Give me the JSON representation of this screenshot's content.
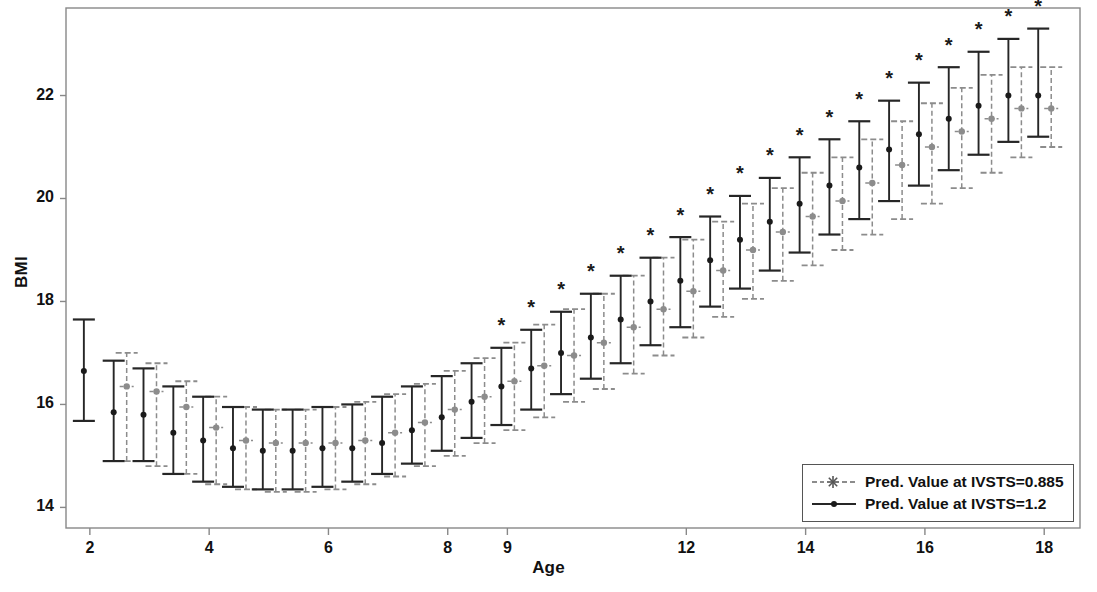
{
  "chart_data": {
    "type": "line",
    "title": "",
    "xlabel": "Age",
    "ylabel": "BMI",
    "xlim": [
      1.6,
      18.6
    ],
    "ylim": [
      13.6,
      23.7
    ],
    "grid": false,
    "x_ticks": [
      2,
      4,
      6,
      8,
      9,
      12,
      14,
      16,
      18
    ],
    "x_tick_labels": [
      "2",
      "4",
      "6",
      "8",
      "9",
      "12",
      "14",
      "16",
      "18"
    ],
    "y_ticks": [
      14,
      16,
      18,
      20,
      22
    ],
    "y_tick_labels": [
      "14",
      "16",
      "18",
      "20",
      "22"
    ],
    "legend_position": "lower-right",
    "marker_style": "point-with-error-bars",
    "annotation_symbol": "*",
    "annotation_note": "asterisk marks ages where the two predicted values differ",
    "x": [
      2,
      2.5,
      3,
      3.5,
      4,
      4.5,
      5,
      5.5,
      6,
      6.5,
      7,
      7.5,
      8,
      8.5,
      9,
      9.5,
      10,
      10.5,
      11,
      11.5,
      12,
      12.5,
      13,
      13.5,
      14,
      14.5,
      15,
      15.5,
      16,
      16.5,
      17,
      17.5,
      18
    ],
    "series": [
      {
        "name": "Pred. Value at IVSTS=0.885",
        "color": "#8c8c8c",
        "linestyle": "dashed",
        "marker": "asterisk",
        "values": [
          null,
          16.35,
          16.25,
          15.95,
          15.55,
          15.3,
          15.25,
          15.25,
          15.25,
          15.3,
          15.45,
          15.65,
          15.9,
          16.15,
          16.45,
          16.75,
          16.95,
          17.2,
          17.5,
          17.85,
          18.2,
          18.6,
          19.0,
          19.35,
          19.65,
          19.95,
          20.3,
          20.65,
          21.0,
          21.3,
          21.55,
          21.75,
          21.75
        ],
        "ci_lower": [
          null,
          14.9,
          14.8,
          14.65,
          14.45,
          14.35,
          14.3,
          14.3,
          14.35,
          14.45,
          14.6,
          14.8,
          15.0,
          15.25,
          15.5,
          15.75,
          16.05,
          16.3,
          16.6,
          16.95,
          17.3,
          17.7,
          18.05,
          18.4,
          18.7,
          19.0,
          19.3,
          19.6,
          19.9,
          20.2,
          20.5,
          20.8,
          21.0
        ],
        "ci_upper": [
          null,
          17.0,
          16.8,
          16.45,
          16.15,
          15.95,
          15.9,
          15.9,
          15.95,
          16.05,
          16.2,
          16.4,
          16.65,
          16.9,
          17.2,
          17.55,
          17.85,
          18.15,
          18.5,
          18.85,
          19.2,
          19.55,
          19.9,
          20.2,
          20.5,
          20.8,
          21.15,
          21.5,
          21.85,
          22.15,
          22.4,
          22.55,
          22.55
        ]
      },
      {
        "name": "Pred. Value at IVSTS=1.2",
        "color": "#262626",
        "linestyle": "solid",
        "marker": "circle",
        "values": [
          16.65,
          15.85,
          15.8,
          15.45,
          15.3,
          15.15,
          15.1,
          15.1,
          15.15,
          15.15,
          15.25,
          15.5,
          15.75,
          16.05,
          16.35,
          16.7,
          17.0,
          17.3,
          17.65,
          18.0,
          18.4,
          18.8,
          19.2,
          19.55,
          19.9,
          20.25,
          20.6,
          20.95,
          21.25,
          21.55,
          21.8,
          22.0,
          22.0
        ],
        "ci_lower": [
          15.68,
          14.9,
          14.9,
          14.65,
          14.5,
          14.4,
          14.35,
          14.35,
          14.4,
          14.5,
          14.65,
          14.85,
          15.1,
          15.35,
          15.6,
          15.9,
          16.2,
          16.5,
          16.8,
          17.15,
          17.5,
          17.9,
          18.25,
          18.6,
          18.95,
          19.3,
          19.6,
          19.95,
          20.25,
          20.55,
          20.85,
          21.1,
          21.2
        ],
        "ci_upper": [
          17.65,
          16.85,
          16.7,
          16.35,
          16.15,
          15.95,
          15.9,
          15.9,
          15.95,
          16.0,
          16.15,
          16.35,
          16.55,
          16.8,
          17.1,
          17.45,
          17.8,
          18.15,
          18.5,
          18.85,
          19.25,
          19.65,
          20.05,
          20.4,
          20.8,
          21.15,
          21.5,
          21.9,
          22.25,
          22.55,
          22.85,
          23.1,
          23.3
        ]
      }
    ],
    "asterisk_ages": [
      9,
      9.5,
      10,
      10.5,
      11,
      11.5,
      12,
      12.5,
      13,
      13.5,
      14,
      14.5,
      15,
      15.5,
      16,
      16.5,
      17,
      17.5,
      18
    ],
    "asterisk_offset_bmi": 0.3
  },
  "legend": {
    "entries": [
      {
        "label": "Pred. Value at IVSTS=0.885",
        "key": "dashed-asterisk-key"
      },
      {
        "label": "Pred. Value at IVSTS=1.2",
        "key": "solid-dot-key"
      }
    ]
  },
  "axes": {
    "x_title": "Age",
    "y_title": "BMI"
  },
  "colors": {
    "series_light": "#8c8c8c",
    "series_dark": "#262626",
    "frame": "#888888",
    "text": "#111111"
  }
}
